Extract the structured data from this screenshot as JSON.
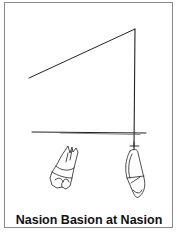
{
  "figure": {
    "caption": "Nasion Basion at Nasion",
    "line_color": "#222222",
    "frame_color": "#8a8a8a",
    "elements": [
      {
        "name": "diagonal-line",
        "from": [
          29,
          78
        ],
        "to": [
          135,
          29
        ]
      },
      {
        "name": "vertical-line",
        "from": [
          135,
          29
        ],
        "to": [
          134,
          147
        ]
      },
      {
        "name": "horizontal-line",
        "from": [
          32,
          132
        ],
        "to": [
          146,
          134
        ]
      },
      {
        "name": "molar-tooth",
        "center": [
          67,
          176
        ]
      },
      {
        "name": "incisor-tooth",
        "center": [
          135,
          172
        ]
      }
    ]
  }
}
